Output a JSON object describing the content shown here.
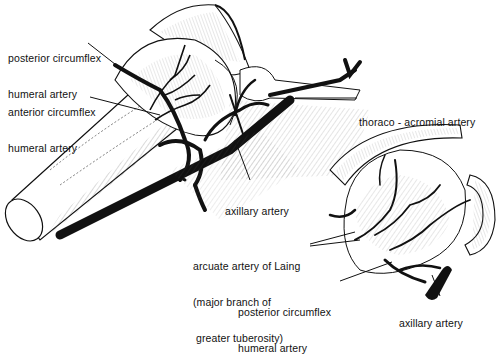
{
  "figure": {
    "type": "anatomical illustration",
    "views": [
      "anterior view of shoulder with humerus",
      "inset view of humeral head"
    ]
  },
  "labels": {
    "posterior_circumflex_top": {
      "line1": "posterior circumflex",
      "line2": "humeral artery"
    },
    "anterior_circumflex": {
      "line1": "anterior circumflex",
      "line2": "humeral artery"
    },
    "thoraco_acromial": {
      "line1": "thoraco - acromial artery"
    },
    "axillary_main": {
      "line1": "axillary artery"
    },
    "arcuate": {
      "line1": "arcuate artery of Laing",
      "line2": "(major branch of",
      "line3": " greater tuberosity)"
    },
    "posterior_circumflex_bottom": {
      "line1": "posterior circumflex",
      "line2": "humeral artery"
    },
    "axillary_inset": {
      "line1": "axillary artery"
    }
  },
  "colors": {
    "ink": "#111111",
    "background": "#ffffff",
    "hatch": "#555555"
  }
}
